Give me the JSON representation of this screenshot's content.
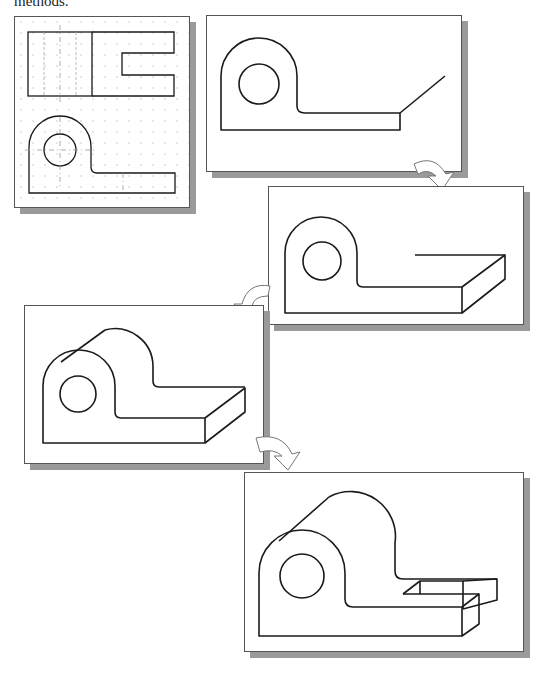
{
  "caption": {
    "text": "methods."
  },
  "figure": {
    "panels": [
      {
        "id": 1,
        "label": "Orthographic views (top and front) on dotted grid"
      },
      {
        "id": 2,
        "label": "Front face profile with receding line"
      },
      {
        "id": 3,
        "label": "Base extruded into isometric depth"
      },
      {
        "id": 4,
        "label": "Rounded boss extended with tangent line"
      },
      {
        "id": 5,
        "label": "Completed isometric with slot cut"
      }
    ],
    "arrows": [
      {
        "from": 2,
        "to": 3
      },
      {
        "from": 3,
        "to": 4
      },
      {
        "from": 4,
        "to": 5
      }
    ]
  },
  "colors": {
    "line": "#1a1a1a",
    "frame": "#555555",
    "shadow": "#9a9a9a",
    "grid": "#bbbbbb"
  }
}
